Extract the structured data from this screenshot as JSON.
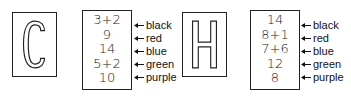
{
  "panels": [
    {
      "letter": "C",
      "values": [
        "3+2",
        "9",
        "14",
        "5+2",
        "10"
      ],
      "labels": [
        "black",
        "red",
        "blue",
        "green",
        "purple"
      ]
    },
    {
      "letter": "H",
      "values": [
        "14",
        "8+1",
        "7+6",
        "12",
        "8"
      ],
      "labels": [
        "black",
        "red",
        "blue",
        "green",
        "purple"
      ]
    }
  ]
}
